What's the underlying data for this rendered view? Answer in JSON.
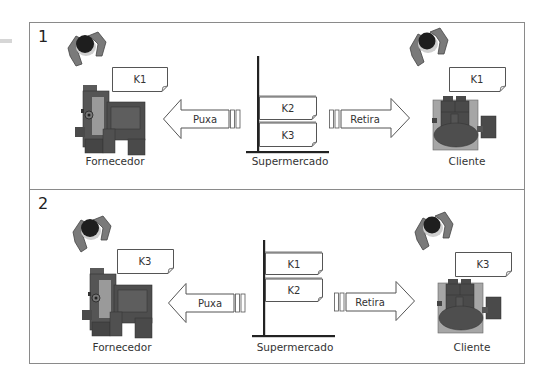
{
  "diagram": {
    "type": "kanban-supermarket-flow",
    "panels": [
      {
        "number": "1",
        "supplier": {
          "label": "Fornecedor",
          "kanban": "K1"
        },
        "pull_arrow": {
          "label": "Puxa",
          "direction": "left"
        },
        "supermarket": {
          "label": "Supermercado",
          "kanbans": [
            "K2",
            "K3"
          ]
        },
        "withdraw_arrow": {
          "label": "Retira",
          "direction": "right"
        },
        "customer": {
          "label": "Cliente",
          "kanban": "K1"
        }
      },
      {
        "number": "2",
        "supplier": {
          "label": "Fornecedor",
          "kanban": "K3"
        },
        "pull_arrow": {
          "label": "Puxa",
          "direction": "left"
        },
        "supermarket": {
          "label": "Supermercado",
          "kanbans": [
            "K1",
            "K2"
          ]
        },
        "withdraw_arrow": {
          "label": "Retira",
          "direction": "right"
        },
        "customer": {
          "label": "Cliente",
          "kanban": "K3"
        }
      }
    ],
    "colors": {
      "frame": "#8a8a8a",
      "machine_dark": "#4a4a4a",
      "machine_mid": "#6b6b6b",
      "machine_light": "#a0a0a0",
      "operator_body": "#7a7a7a",
      "operator_head": "#1e1e1e",
      "card_border": "#555555",
      "shelf": "#222222"
    }
  }
}
